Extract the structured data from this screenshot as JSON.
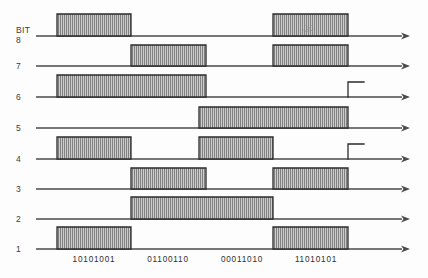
{
  "diagram": {
    "title_label": "BIT",
    "type": "digital-timing-waveform",
    "canvas": {
      "width": 428,
      "height": 278
    },
    "axis": {
      "start_x": 36,
      "arrow_tip_x": 410,
      "slot_start_x": 57,
      "slot_width": 74,
      "slot_count": 4
    },
    "colors": {
      "line": "#4a4a4a",
      "pulse_border": "#2b2b2b",
      "pulse_fill_light": "#c9c9c9",
      "pulse_fill_stripe": "#6e6e6e",
      "text": "#2e2e2e",
      "background": "#fdfdfd"
    },
    "rows": [
      {
        "name": "bit-8",
        "label": "8",
        "head": "BIT",
        "baseline_y": 36,
        "pulse_height": 22,
        "pulses": [
          {
            "start": 57,
            "end": 131
          },
          {
            "start": 273,
            "end": 348
          }
        ],
        "steps": []
      },
      {
        "name": "bit-7",
        "label": "7",
        "head": "",
        "baseline_y": 66,
        "pulse_height": 21,
        "pulses": [
          {
            "start": 131,
            "end": 206
          },
          {
            "start": 273,
            "end": 348
          }
        ],
        "steps": []
      },
      {
        "name": "bit-6",
        "label": "6",
        "head": "",
        "baseline_y": 97,
        "pulse_height": 22,
        "pulses": [
          {
            "start": 57,
            "end": 206
          }
        ],
        "steps": [
          {
            "start": 348,
            "end": 364,
            "height": 15
          }
        ]
      },
      {
        "name": "bit-5",
        "label": "5",
        "head": "",
        "baseline_y": 128,
        "pulse_height": 21,
        "pulses": [
          {
            "start": 199,
            "end": 348
          }
        ],
        "steps": []
      },
      {
        "name": "bit-4",
        "label": "4",
        "head": "",
        "baseline_y": 159,
        "pulse_height": 22,
        "pulses": [
          {
            "start": 57,
            "end": 131
          },
          {
            "start": 199,
            "end": 273
          }
        ],
        "steps": [
          {
            "start": 348,
            "end": 364,
            "height": 15
          }
        ]
      },
      {
        "name": "bit-3",
        "label": "3",
        "head": "",
        "baseline_y": 189,
        "pulse_height": 21,
        "pulses": [
          {
            "start": 131,
            "end": 206
          },
          {
            "start": 273,
            "end": 348
          }
        ],
        "steps": []
      },
      {
        "name": "bit-2",
        "label": "2",
        "head": "",
        "baseline_y": 219,
        "pulse_height": 22,
        "pulses": [
          {
            "start": 131,
            "end": 273
          }
        ],
        "steps": []
      },
      {
        "name": "bit-1",
        "label": "1",
        "head": "",
        "baseline_y": 249,
        "pulse_height": 22,
        "pulses": [
          {
            "start": 57,
            "end": 131
          },
          {
            "start": 273,
            "end": 348
          }
        ],
        "steps": []
      }
    ],
    "byte_labels": [
      {
        "text": "10101001",
        "center_x": 94,
        "y": 260
      },
      {
        "text": "01100110",
        "center_x": 168,
        "y": 260
      },
      {
        "text": "00011010",
        "center_x": 242,
        "y": 260
      },
      {
        "text": "11010101",
        "center_x": 316,
        "y": 260
      }
    ]
  },
  "chart_data": {
    "type": "line",
    "xlabel": "",
    "ylabel": "BIT",
    "grid": false,
    "legend": "none",
    "x": [
      "10101001",
      "01100110",
      "00011010",
      "11010101"
    ],
    "series": [
      {
        "name": "BIT 8",
        "values": [
          1,
          0,
          0,
          1
        ]
      },
      {
        "name": "BIT 7",
        "values": [
          0,
          1,
          0,
          1
        ]
      },
      {
        "name": "BIT 6",
        "values": [
          1,
          1,
          0,
          0
        ]
      },
      {
        "name": "BIT 5",
        "values": [
          0,
          0,
          1,
          1
        ]
      },
      {
        "name": "BIT 4",
        "values": [
          1,
          0,
          1,
          0
        ]
      },
      {
        "name": "BIT 3",
        "values": [
          0,
          1,
          0,
          1
        ]
      },
      {
        "name": "BIT 2",
        "values": [
          0,
          1,
          1,
          0
        ]
      },
      {
        "name": "BIT 1",
        "values": [
          1,
          0,
          0,
          1
        ]
      }
    ],
    "ylim": [
      0,
      1
    ]
  }
}
